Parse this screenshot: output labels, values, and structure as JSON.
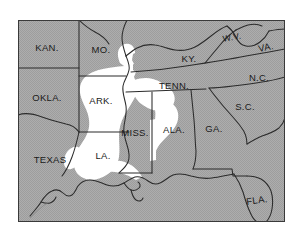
{
  "figure": {
    "kind": "reference-map",
    "width": 293,
    "height": 232
  },
  "map": {
    "frame": {
      "x": 18,
      "y": 20,
      "width": 267,
      "height": 202
    },
    "colors": {
      "land_fill": "#a9a9a9",
      "highlight_fill": "#ffffff",
      "page_background": "#ffffff",
      "border_stroke": "#2b2b2b",
      "label_text": "#1a1a1a",
      "frame_stroke": "#3a3a3a"
    },
    "legend_note": "White areas indicate the highlighted alluvial / Delta region; gray areas are surrounding land.",
    "state_labels": [
      {
        "id": "kansas",
        "text": "KAN.",
        "x": 47,
        "y": 48,
        "size": "normal"
      },
      {
        "id": "missouri",
        "text": "MO.",
        "x": 101,
        "y": 50,
        "size": "normal"
      },
      {
        "id": "kentucky",
        "text": "KY.",
        "x": 189,
        "y": 59,
        "size": "normal"
      },
      {
        "id": "west-virginia",
        "text": "W.V.",
        "x": 232,
        "y": 38,
        "size": "small"
      },
      {
        "id": "virginia",
        "text": "VA.",
        "x": 266,
        "y": 48,
        "size": "normal"
      },
      {
        "id": "oklahoma",
        "text": "OKLA.",
        "x": 47,
        "y": 98,
        "size": "normal"
      },
      {
        "id": "arkansas",
        "text": "ARK.",
        "x": 101,
        "y": 101,
        "size": "normal"
      },
      {
        "id": "tennessee",
        "text": "TENN.",
        "x": 174,
        "y": 86,
        "size": "normal"
      },
      {
        "id": "north-carolina",
        "text": "N.C.",
        "x": 259,
        "y": 78,
        "size": "normal"
      },
      {
        "id": "south-carolina",
        "text": "S.C.",
        "x": 245,
        "y": 107,
        "size": "normal"
      },
      {
        "id": "mississippi",
        "text": "MISS.",
        "x": 135,
        "y": 133,
        "size": "normal"
      },
      {
        "id": "alabama",
        "text": "ALA.",
        "x": 174,
        "y": 130,
        "size": "normal"
      },
      {
        "id": "georgia",
        "text": "GA.",
        "x": 214,
        "y": 129,
        "size": "normal"
      },
      {
        "id": "texas",
        "text": "TEXAS",
        "x": 50,
        "y": 160,
        "size": "normal"
      },
      {
        "id": "louisiana",
        "text": "LA.",
        "x": 103,
        "y": 156,
        "size": "normal"
      },
      {
        "id": "florida",
        "text": "FLA.",
        "x": 257,
        "y": 201,
        "size": "normal"
      }
    ]
  }
}
